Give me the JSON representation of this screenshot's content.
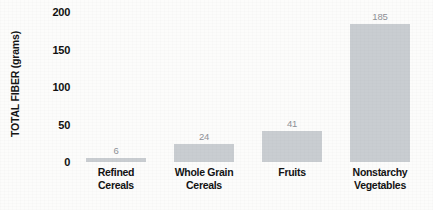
{
  "chart_data": {
    "type": "bar",
    "title": "",
    "subtitle": "",
    "xlabel": "",
    "ylabel": "TOTAL FIBER (grams)",
    "categories": [
      "Refined Cereals",
      "Whole Grain Cereals",
      "Fruits",
      "Nonstarchy Vegetables"
    ],
    "category_lines": [
      [
        "Refined",
        "Cereals"
      ],
      [
        "Whole Grain",
        "Cereals"
      ],
      [
        "Fruits"
      ],
      [
        "Nonstarchy",
        "Vegetables"
      ]
    ],
    "values": [
      6,
      24,
      41,
      185
    ],
    "value_labels": [
      "6",
      "24",
      "41",
      "185"
    ],
    "ylim": [
      0,
      200
    ],
    "yticks": [
      0,
      50,
      100,
      150,
      200
    ],
    "ytick_labels": [
      "0",
      "50",
      "100",
      "150",
      "200"
    ],
    "grid": false,
    "legend": false,
    "legend_position": "none",
    "bar_color": "#c9cdd1",
    "value_label_color": "#8e9196",
    "axis_text_color": "#131313",
    "background_color": "#fcfcfb"
  }
}
